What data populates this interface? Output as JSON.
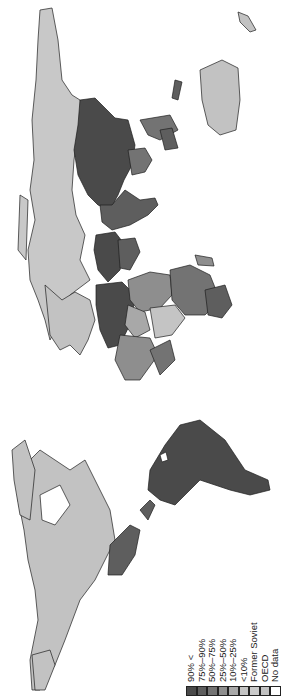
{
  "map": {
    "orientation": "rotated 90 degrees counter-clockwise (north to the left)",
    "projection": "world",
    "colors": {
      "c90plus": "#4a4a4a",
      "c75_90": "#5e5e5e",
      "c50_75": "#737373",
      "c25_50": "#8e8e8e",
      "c10_25": "#a8a8a8",
      "clt10": "#c4c4c4",
      "former_soviet": "#c8c8c8",
      "oecd": "#c2c2c2",
      "no_data": "#ffffff"
    }
  },
  "legend": {
    "items": [
      {
        "label": "90% <",
        "color": "#4a4a4a"
      },
      {
        "label": "75%–90%",
        "color": "#5e5e5e"
      },
      {
        "label": "50%–75%",
        "color": "#737373"
      },
      {
        "label": "25%–50%",
        "color": "#8e8e8e"
      },
      {
        "label": "10%–25%",
        "color": "#a8a8a8"
      },
      {
        "label": "<10%",
        "color": "#c4c4c4"
      },
      {
        "label": "Former Soviet",
        "color": "#cbcbcb"
      },
      {
        "label": "OECD",
        "color": "#c2c2c2"
      },
      {
        "label": "No data",
        "color": "#ffffff"
      }
    ]
  }
}
